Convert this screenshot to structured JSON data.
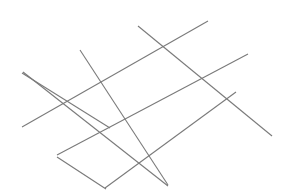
{
  "figure": {
    "type": "line-drawing",
    "canvas": {
      "width": 291,
      "height": 196,
      "background_color": "#ffffff"
    },
    "style": {
      "stroke_color": "#7a7a7a",
      "stroke_width": 1.1,
      "line_cap": "butt"
    },
    "line_families": [
      {
        "name": "descending-family",
        "direction": "upper-left to lower-right",
        "count": 4,
        "approx_slope": 0.62
      },
      {
        "name": "ascending-family",
        "direction": "lower-left to upper-right",
        "count": 4,
        "approx_slope": -0.34
      }
    ],
    "lines": [
      {
        "id": "desc-1",
        "family": "descending-family",
        "x1": 22,
        "y1": 73,
        "x2": 110,
        "y2": 128
      },
      {
        "id": "desc-2",
        "family": "descending-family",
        "x1": 80,
        "y1": 50,
        "x2": 168,
        "y2": 185
      },
      {
        "id": "desc-3",
        "family": "descending-family",
        "x1": 138,
        "y1": 26,
        "x2": 272,
        "y2": 136
      },
      {
        "id": "desc-4",
        "family": "descending-family",
        "x1": 57,
        "y1": 157,
        "x2": 106,
        "y2": 189
      },
      {
        "id": "asc-1",
        "family": "ascending-family",
        "x1": 22,
        "y1": 127,
        "x2": 208,
        "y2": 21
      },
      {
        "id": "asc-2",
        "family": "ascending-family",
        "x1": 57,
        "y1": 155,
        "x2": 248,
        "y2": 54
      },
      {
        "id": "asc-3",
        "family": "ascending-family",
        "x1": 105,
        "y1": 188,
        "x2": 236,
        "y2": 92
      },
      {
        "id": "asc-4",
        "family": "ascending-family",
        "x1": 23,
        "y1": 72,
        "x2": 168,
        "y2": 186
      }
    ]
  }
}
